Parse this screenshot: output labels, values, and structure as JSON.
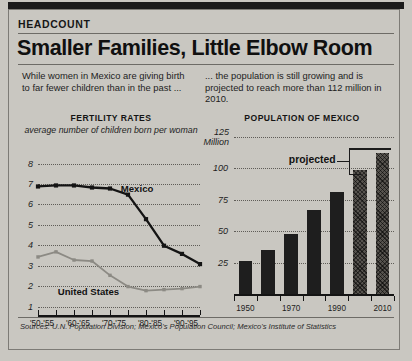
{
  "kicker": "HEADCOUNT",
  "headline": "Smaller Families, Little Elbow Room",
  "deck_left": "While women in Mexico are giving birth to far fewer children than in the past ...",
  "deck_right": "... the population is still growing and is projected to reach more than 112 million in 2010.",
  "sources": "Sources: U.N. Population Division; Mexico's Population Council; Mexico's Institute of Statistics",
  "colors": {
    "page_background": "#c9c7c1",
    "ink": "#141414",
    "mexico_line": "#141414",
    "united_states_line": "#8c8a84",
    "bar_actual": "#1e1e1e",
    "bar_projected": "#56534e",
    "rule": "#6d6b66"
  },
  "chart_data": [
    {
      "type": "line",
      "title": "FERTILITY RATES",
      "subtitle": "average number of children born per woman",
      "xlabel": "",
      "ylabel": "",
      "grid": true,
      "legend_position": "inline",
      "ylim": [
        1,
        8
      ],
      "yticks": [
        8,
        7,
        6,
        5,
        4,
        3,
        2,
        1
      ],
      "categories": [
        "'50-'55",
        "'55-'60",
        "'60-'65",
        "'65-'70",
        "'70-'75",
        "'75-'80",
        "'80-'85",
        "'85-'90",
        "'90-'95"
      ],
      "tick_labels": [
        "'50-'55",
        "'60-'65",
        "'70-'75",
        "'80-'85",
        "'90-'95"
      ],
      "series": [
        {
          "name": "Mexico",
          "color": "#141414",
          "values": [
            6.9,
            6.95,
            6.95,
            6.85,
            6.8,
            6.5,
            5.3,
            4.0,
            3.6,
            3.1
          ]
        },
        {
          "name": "United States",
          "color": "#8c8a84",
          "values": [
            3.45,
            3.7,
            3.3,
            3.25,
            2.55,
            2.0,
            1.8,
            1.85,
            1.9,
            2.0
          ]
        }
      ],
      "annotations": [
        {
          "text": "Mexico",
          "x": 4.6,
          "y": 6.75
        },
        {
          "text": "United States",
          "x": 1.1,
          "y": 1.7
        }
      ]
    },
    {
      "type": "bar",
      "title": "POPULATION OF MEXICO",
      "xlabel": "",
      "ylabel": "",
      "y_unit_label": "125 Million",
      "grid": true,
      "ylim": [
        0,
        125
      ],
      "yticks": [
        125,
        100,
        75,
        50,
        25
      ],
      "ytick_labels": [
        "125 Million",
        "100",
        "75",
        "50",
        "25"
      ],
      "categories": [
        "1950",
        "1960",
        "1970",
        "1980",
        "1990",
        "2000",
        "2010"
      ],
      "tick_labels": [
        "1950",
        "1970",
        "1990",
        "2010"
      ],
      "values": [
        26,
        35,
        48,
        67,
        81,
        99,
        112
      ],
      "projected_from_index": 5,
      "annotations": [
        {
          "text": "projected",
          "target_bars": [
            5,
            6
          ]
        }
      ]
    }
  ]
}
